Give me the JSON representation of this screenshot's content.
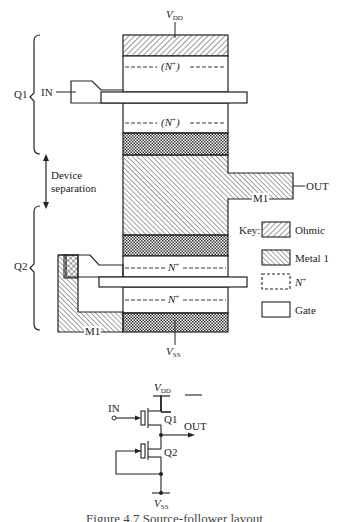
{
  "layout": {
    "supply_top": {
      "main": "V",
      "sub": "DD"
    },
    "supply_bottom": {
      "main": "V",
      "sub": "SS"
    },
    "input_label": "IN",
    "output_label": "OUT",
    "metal_label_right": "M1",
    "metal_label_left": "M1",
    "n_plus_paren": {
      "main": "(N",
      "sup": "+",
      "close": ")"
    },
    "n_plus": {
      "main": "N",
      "sup": "+"
    },
    "transistor_labels": {
      "q1": "Q1",
      "q2": "Q2"
    },
    "device_separation": [
      "Device",
      "separation"
    ]
  },
  "key": {
    "title": "Key:",
    "items": [
      {
        "label": "Ohmic",
        "pattern": "ohmic-hatch"
      },
      {
        "label": "Metal 1",
        "pattern": "metal1-hatch"
      },
      {
        "label": "N",
        "sup": "+",
        "pattern": "dashed-box"
      },
      {
        "label": "Gate",
        "pattern": "plain-box"
      }
    ]
  },
  "schematic": {
    "vdd": {
      "main": "V",
      "sub": "DD"
    },
    "vss": {
      "main": "V",
      "sub": "SS"
    },
    "in": "IN",
    "out": "OUT",
    "q1": "Q1",
    "q2": "Q2"
  },
  "caption": "Figure 4.7  Source-follower layout",
  "colors": {
    "ink": "#222222",
    "background": "#ffffff"
  }
}
